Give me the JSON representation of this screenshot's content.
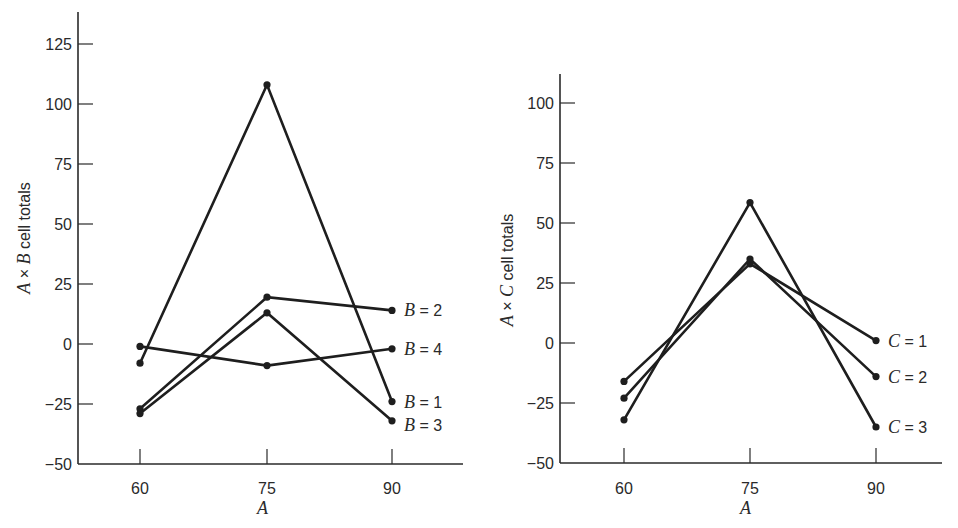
{
  "chart_data": [
    {
      "type": "line",
      "title": "",
      "xlabel": "A",
      "ylabel": "A × B cell totals",
      "ylabel_parts": {
        "v1": "A",
        "op": " × ",
        "v2": "B",
        "rest": " cell totals"
      },
      "x": [
        60,
        75,
        90
      ],
      "x_tick_labels": [
        "60",
        "75",
        "90"
      ],
      "y_ticks": [
        125,
        100,
        75,
        50,
        25,
        0,
        -25,
        -50
      ],
      "y_tick_labels": [
        "125",
        "100",
        "75",
        "50",
        "25",
        "0",
        "−25",
        "−50"
      ],
      "ylim": [
        -50,
        137
      ],
      "grid": false,
      "legend_position": "inline-right",
      "series": [
        {
          "name": "B = 1",
          "var": "B",
          "level": "1",
          "values": [
            -8,
            108,
            -24
          ]
        },
        {
          "name": "B = 2",
          "var": "B",
          "level": "2",
          "values": [
            -27,
            19.5,
            14
          ]
        },
        {
          "name": "B = 3",
          "var": "B",
          "level": "3",
          "values": [
            -29,
            13,
            -32
          ]
        },
        {
          "name": "B = 4",
          "var": "B",
          "level": "4",
          "values": [
            -1,
            -9,
            -2
          ]
        }
      ],
      "label_offsets": {
        "B = 1": 0,
        "B = 2": 0,
        "B = 3": 4,
        "B = 4": 0
      }
    },
    {
      "type": "line",
      "title": "",
      "xlabel": "A",
      "ylabel": "A × C cell totals",
      "ylabel_parts": {
        "v1": "A",
        "op": " × ",
        "v2": "C",
        "rest": " cell totals"
      },
      "x": [
        60,
        75,
        90
      ],
      "x_tick_labels": [
        "60",
        "75",
        "90"
      ],
      "y_ticks": [
        100,
        75,
        50,
        25,
        0,
        -25,
        -50
      ],
      "y_tick_labels": [
        "100",
        "75",
        "50",
        "25",
        "0",
        "−25",
        "−50"
      ],
      "ylim": [
        -50,
        112
      ],
      "grid": false,
      "legend_position": "inline-right",
      "series": [
        {
          "name": "C = 1",
          "var": "C",
          "level": "1",
          "values": [
            -16,
            33,
            1
          ]
        },
        {
          "name": "C = 2",
          "var": "C",
          "level": "2",
          "values": [
            -23,
            35,
            -14
          ]
        },
        {
          "name": "C = 3",
          "var": "C",
          "level": "3",
          "values": [
            -32,
            58.5,
            -35
          ]
        }
      ],
      "label_offsets": {
        "C = 1": 0,
        "C = 2": 0,
        "C = 3": 0
      }
    }
  ],
  "style": {
    "line_color": "#1e1e1e",
    "axis_color": "#2a2a2a"
  }
}
